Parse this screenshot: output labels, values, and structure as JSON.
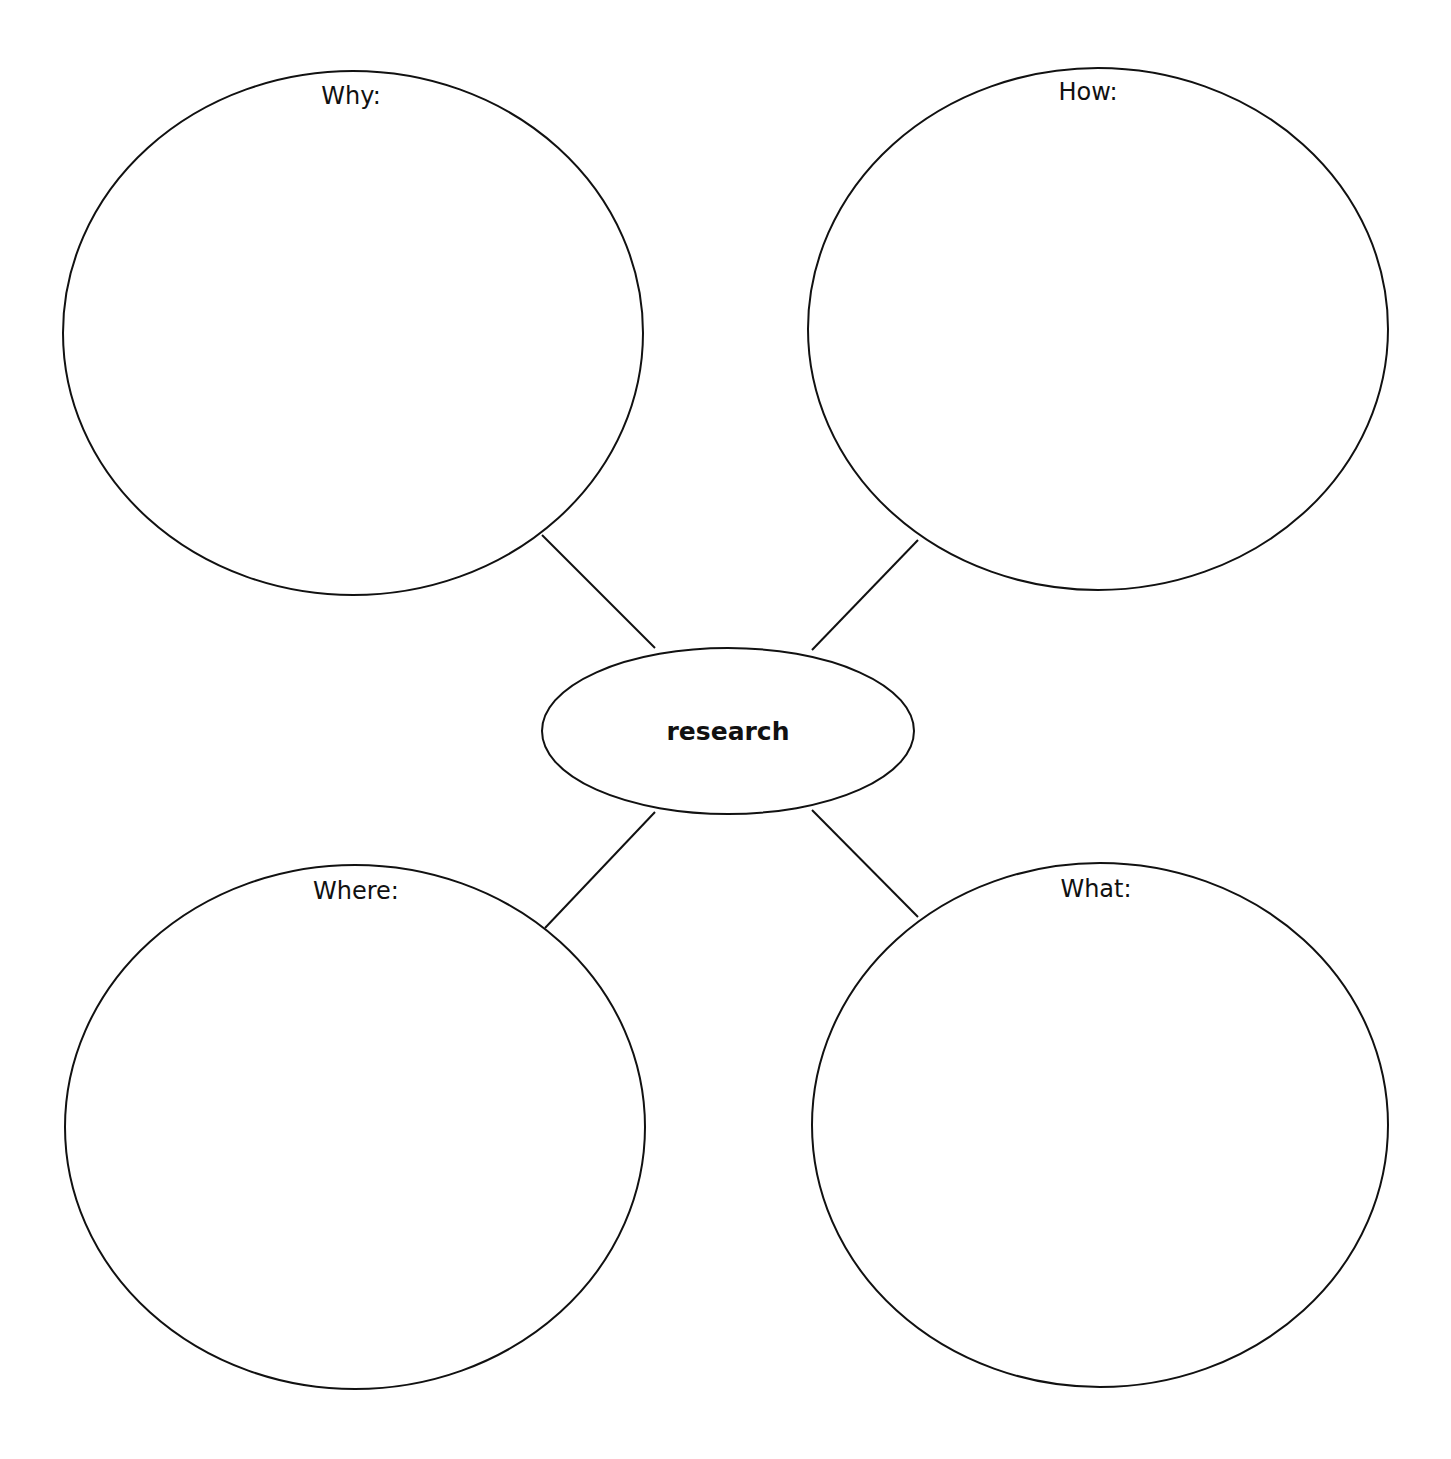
{
  "page": {
    "top_clipped_text": ""
  },
  "diagram": {
    "type": "mind-map",
    "stroke_color": "#111111",
    "background_color": "#ffffff",
    "center": {
      "label": "research",
      "shape": "ellipse",
      "cx": 728,
      "cy": 731,
      "rx": 186,
      "ry": 83
    },
    "nodes": [
      {
        "id": "why",
        "label": "Why:",
        "cx": 353,
        "cy": 333,
        "rx": 290,
        "ry": 262,
        "label_x": 351,
        "label_y": 82
      },
      {
        "id": "how",
        "label": "How:",
        "cx": 1098,
        "cy": 329,
        "rx": 290,
        "ry": 261,
        "label_x": 1088,
        "label_y": 78
      },
      {
        "id": "where",
        "label": "Where:",
        "cx": 355,
        "cy": 1127,
        "rx": 290,
        "ry": 262,
        "label_x": 356,
        "label_y": 877
      },
      {
        "id": "what",
        "label": "What:",
        "cx": 1100,
        "cy": 1125,
        "rx": 288,
        "ry": 262,
        "label_x": 1096,
        "label_y": 875
      }
    ],
    "connectors": [
      {
        "from": "why",
        "x1": 542,
        "y1": 535,
        "x2": 655,
        "y2": 648
      },
      {
        "from": "how",
        "x1": 918,
        "y1": 540,
        "x2": 812,
        "y2": 650
      },
      {
        "from": "where",
        "x1": 545,
        "y1": 928,
        "x2": 655,
        "y2": 812
      },
      {
        "from": "what",
        "x1": 918,
        "y1": 917,
        "x2": 812,
        "y2": 810
      }
    ]
  }
}
